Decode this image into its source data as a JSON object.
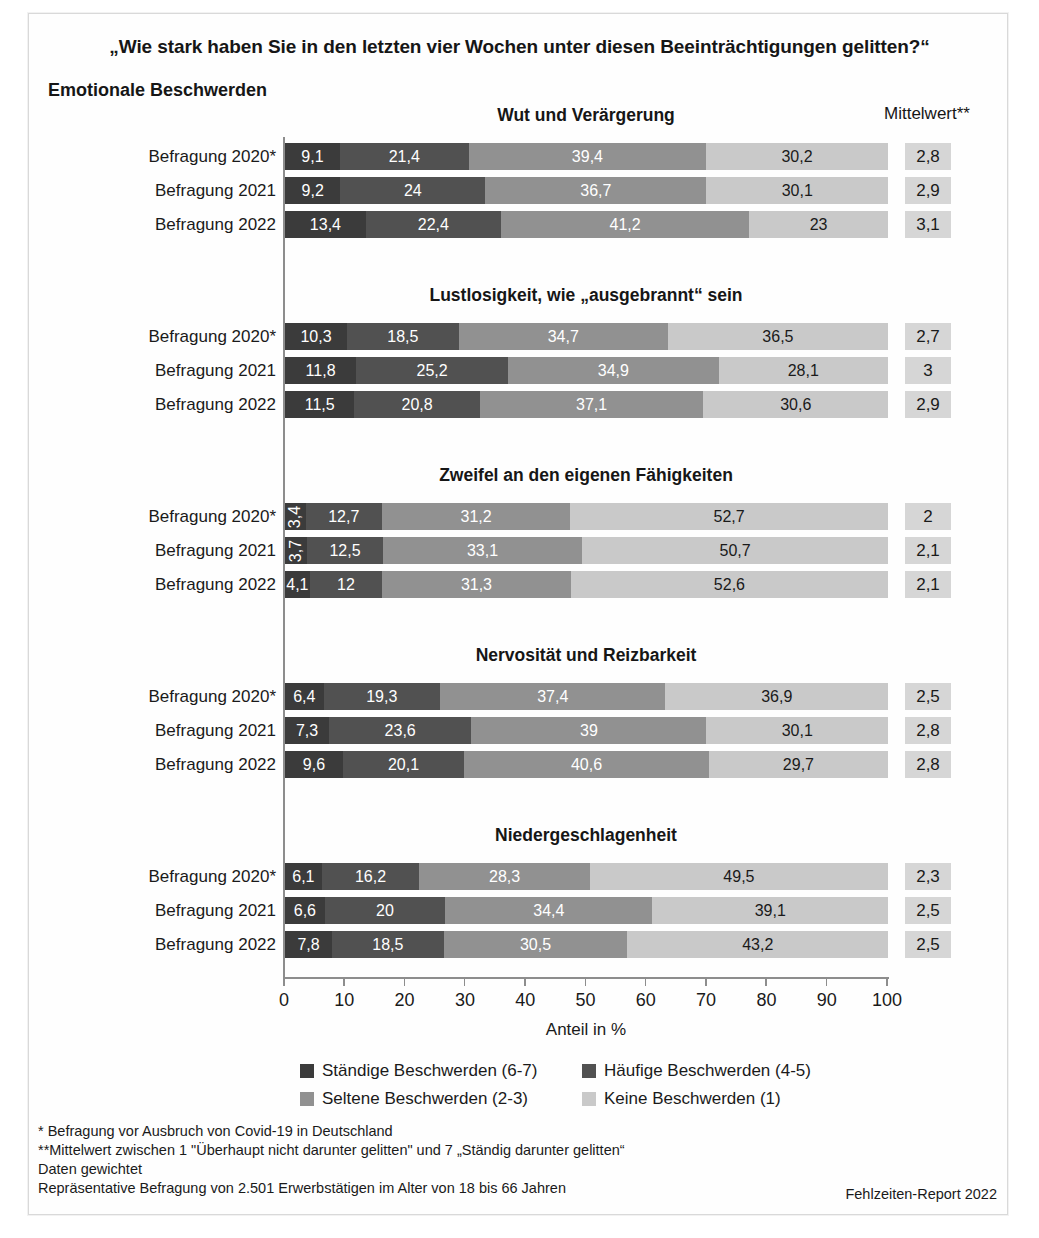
{
  "header": {
    "question_title": "„Wie stark haben Sie in den letzten vier Wochen unter diesen Beeinträchtigungen gelitten?“",
    "section_label": "Emotionale Beschwerden",
    "mittelwert_header": "Mittelwert**"
  },
  "axis": {
    "caption": "Anteil in %",
    "ticks": [
      "0",
      "10",
      "20",
      "30",
      "40",
      "50",
      "60",
      "70",
      "80",
      "90",
      "100"
    ]
  },
  "legend": [
    {
      "label": "Ständige Beschwerden (6-7)",
      "color": "#3b3b3b"
    },
    {
      "label": "Häufige Beschwerden (4-5)",
      "color": "#515151"
    },
    {
      "label": "Seltene Beschwerden (2-3)",
      "color": "#919191"
    },
    {
      "label": "Keine Beschwerden (1)",
      "color": "#c9c9c9"
    }
  ],
  "footnotes": [
    "*  Befragung vor Ausbruch von Covid-19 in Deutschland",
    "**Mittelwert zwischen 1 \"Überhaupt nicht darunter gelitten\" und 7 „Ständig darunter gelitten“",
    "Daten gewichtet",
    "Repräsentative Befragung von 2.501 Erwerbstätigen im Alter von 18 bis 66 Jahren"
  ],
  "source": "Fehlzeiten-Report 2022",
  "chart_data": {
    "type": "bar",
    "title": "„Wie stark haben Sie in den letzten vier Wochen unter diesen Beeinträchtigungen gelitten?“",
    "subtitle": "Emotionale Beschwerden",
    "xlabel": "Anteil in %",
    "ylabel": "",
    "xlim": [
      0,
      100
    ],
    "grid": false,
    "legend_position": "bottom",
    "orientation": "horizontal-stacked",
    "series_names": [
      "Ständige Beschwerden (6-7)",
      "Häufige Beschwerden (4-5)",
      "Seltene Beschwerden (2-3)",
      "Keine Beschwerden (1)"
    ],
    "series_colors": [
      "#3b3b3b",
      "#515151",
      "#919191",
      "#c9c9c9"
    ],
    "groups": [
      {
        "title": "Wut und Verärgerung",
        "rows": [
          {
            "label": "Befragung 2020*",
            "values": [
              9.1,
              21.4,
              39.4,
              30.2
            ],
            "labels": [
              "9,1",
              "21,4",
              "39,4",
              "30,2"
            ],
            "mean": "2,8"
          },
          {
            "label": "Befragung 2021",
            "values": [
              9.2,
              24,
              36.7,
              30.1
            ],
            "labels": [
              "9,2",
              "24",
              "36,7",
              "30,1"
            ],
            "mean": "2,9"
          },
          {
            "label": "Befragung 2022",
            "values": [
              13.4,
              22.4,
              41.2,
              23
            ],
            "labels": [
              "13,4",
              "22,4",
              "41,2",
              "23"
            ],
            "mean": "3,1"
          }
        ]
      },
      {
        "title": "Lustlosigkeit, wie „ausgebrannt“ sein",
        "rows": [
          {
            "label": "Befragung 2020*",
            "values": [
              10.3,
              18.5,
              34.7,
              36.5
            ],
            "labels": [
              "10,3",
              "18,5",
              "34,7",
              "36,5"
            ],
            "mean": "2,7"
          },
          {
            "label": "Befragung 2021",
            "values": [
              11.8,
              25.2,
              34.9,
              28.1
            ],
            "labels": [
              "11,8",
              "25,2",
              "34,9",
              "28,1"
            ],
            "mean": "3"
          },
          {
            "label": "Befragung 2022",
            "values": [
              11.5,
              20.8,
              37.1,
              30.6
            ],
            "labels": [
              "11,5",
              "20,8",
              "37,1",
              "30,6"
            ],
            "mean": "2,9"
          }
        ]
      },
      {
        "title": "Zweifel an den eigenen Fähigkeiten",
        "rows": [
          {
            "label": "Befragung 2020*",
            "values": [
              3.4,
              12.7,
              31.2,
              52.7
            ],
            "labels": [
              "3,4",
              "12,7",
              "31,2",
              "52,7"
            ],
            "rotated": [
              true,
              false,
              false,
              false
            ],
            "mean": "2"
          },
          {
            "label": "Befragung 2021",
            "values": [
              3.7,
              12.5,
              33.1,
              50.7
            ],
            "labels": [
              "3,7",
              "12,5",
              "33,1",
              "50,7"
            ],
            "rotated": [
              true,
              false,
              false,
              false
            ],
            "mean": "2,1"
          },
          {
            "label": "Befragung 2022",
            "values": [
              4.1,
              12,
              31.3,
              52.6
            ],
            "labels": [
              "4,1",
              "12",
              "31,3",
              "52,6"
            ],
            "rotated": [
              false,
              false,
              false,
              false
            ],
            "mean": "2,1"
          }
        ]
      },
      {
        "title": "Nervosität und Reizbarkeit",
        "rows": [
          {
            "label": "Befragung 2020*",
            "values": [
              6.4,
              19.3,
              37.4,
              36.9
            ],
            "labels": [
              "6,4",
              "19,3",
              "37,4",
              "36,9"
            ],
            "mean": "2,5"
          },
          {
            "label": "Befragung 2021",
            "values": [
              7.3,
              23.6,
              39,
              30.1
            ],
            "labels": [
              "7,3",
              "23,6",
              "39",
              "30,1"
            ],
            "mean": "2,8"
          },
          {
            "label": "Befragung 2022",
            "values": [
              9.6,
              20.1,
              40.6,
              29.7
            ],
            "labels": [
              "9,6",
              "20,1",
              "40,6",
              "29,7"
            ],
            "mean": "2,8"
          }
        ]
      },
      {
        "title": "Niedergeschlagenheit",
        "rows": [
          {
            "label": "Befragung 2020*",
            "values": [
              6.1,
              16.2,
              28.3,
              49.5
            ],
            "labels": [
              "6,1",
              "16,2",
              "28,3",
              "49,5"
            ],
            "mean": "2,3"
          },
          {
            "label": "Befragung 2021",
            "values": [
              6.6,
              20,
              34.4,
              39.1
            ],
            "labels": [
              "6,6",
              "20",
              "34,4",
              "39,1"
            ],
            "mean": "2,5"
          },
          {
            "label": "Befragung 2022",
            "values": [
              7.8,
              18.5,
              30.5,
              43.2
            ],
            "labels": [
              "7,8",
              "18,5",
              "30,5",
              "43,2"
            ],
            "mean": "2,5"
          }
        ]
      }
    ]
  }
}
